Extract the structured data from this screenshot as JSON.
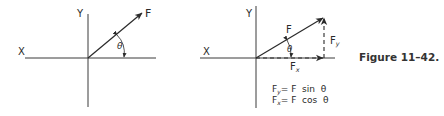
{
  "caption": "Figure 11–42.",
  "left_diagram": {
    "x_axis_label": "X",
    "y_axis_label": "Y",
    "vector_label": "F",
    "angle_label": "θ"
  },
  "right_diagram": {
    "x_axis_label": "X",
    "y_axis_label": "Y",
    "vector_label": "F",
    "angle_label": "θ",
    "component_x_label": "F",
    "component_x_sub": "x",
    "component_y_label": "F",
    "component_y_sub": "y",
    "equations": [
      {
        "lhs": "F",
        "sub": "y",
        "rhs": "= F  sin  θ"
      },
      {
        "lhs": "F",
        "sub": "x",
        "rhs": "= F  cos  θ"
      }
    ]
  },
  "colors": {
    "ink": "#2a2a2a",
    "background": "#ffffff"
  }
}
